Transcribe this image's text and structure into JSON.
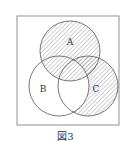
{
  "diagram": {
    "type": "venn",
    "sets": [
      "A",
      "B",
      "C"
    ],
    "shaded_regions": [
      "A only",
      "A∩B only",
      "A∩C only",
      "A∩B∩C",
      "C only"
    ],
    "unshaded_regions": [
      "B only",
      "B∩C only"
    ],
    "labels": {
      "a": "A",
      "b": "B",
      "c": "C"
    },
    "caption": "図3"
  }
}
